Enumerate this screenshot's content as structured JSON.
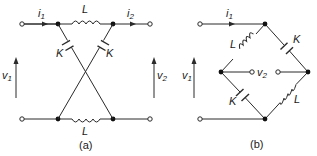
{
  "figure": {
    "panels": [
      {
        "id": "a",
        "caption": "(a)",
        "labels": {
          "i1": "i",
          "i1_sub": "1",
          "i2": "i",
          "i2_sub": "2",
          "v1": "v",
          "v1_sub": "1",
          "v2": "v",
          "v2_sub": "2",
          "L_top": "L",
          "L_bottom": "L",
          "K_left": "K",
          "K_right": "K"
        },
        "description": "Lattice (crossed) network: series inductors L on top and bottom lines, cross-connected capacitors K"
      },
      {
        "id": "b",
        "caption": "(b)",
        "labels": {
          "i1": "i",
          "i1_sub": "1",
          "v1": "v",
          "v1_sub": "1",
          "v2": "v",
          "v2_sub": "2",
          "L_upper_left": "L",
          "K_upper_right": "K",
          "K_lower_left": "K",
          "L_lower_right": "L"
        },
        "description": "Equivalent bridge (diamond) form of the lattice network"
      }
    ]
  }
}
